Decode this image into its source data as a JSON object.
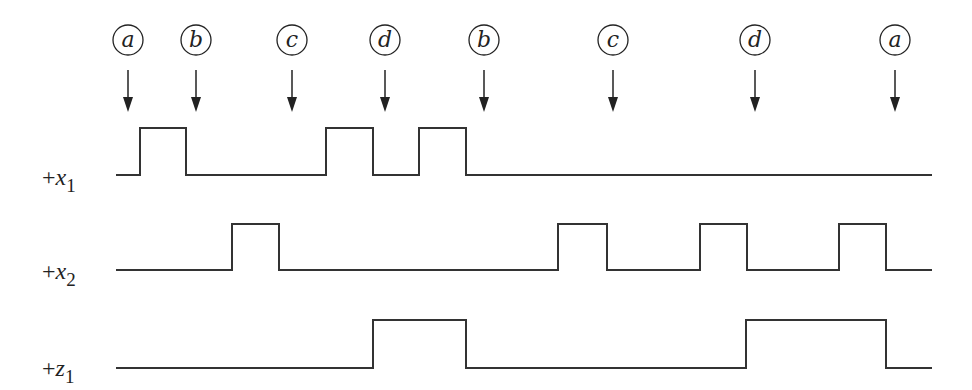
{
  "diagram": {
    "type": "timing-diagram",
    "events": [
      {
        "label": "a",
        "x": 128
      },
      {
        "label": "b",
        "x": 196
      },
      {
        "label": "c",
        "x": 292
      },
      {
        "label": "d",
        "x": 385
      },
      {
        "label": "b",
        "x": 484
      },
      {
        "label": "c",
        "x": 613
      },
      {
        "label": "d",
        "x": 755
      },
      {
        "label": "a",
        "x": 895
      }
    ],
    "signals": [
      {
        "prefix": "+",
        "var": "x",
        "sub": "1",
        "label_y": 190,
        "low_y": 175,
        "high_y": 128,
        "start_x": 116,
        "end_x": 932,
        "pulses": [
          [
            140,
            186
          ],
          [
            326,
            373
          ],
          [
            419,
            466
          ]
        ]
      },
      {
        "prefix": "+",
        "var": "x",
        "sub": "2",
        "label_y": 284,
        "low_y": 270,
        "high_y": 224,
        "start_x": 116,
        "end_x": 932,
        "pulses": [
          [
            232,
            279
          ],
          [
            558,
            607
          ],
          [
            700,
            747
          ],
          [
            839,
            886
          ]
        ]
      },
      {
        "prefix": "+",
        "var": "z",
        "sub": "1",
        "label_y": 381,
        "low_y": 368,
        "high_y": 320,
        "start_x": 116,
        "end_x": 932,
        "pulses": [
          [
            373,
            466
          ],
          [
            746,
            886
          ]
        ]
      }
    ],
    "colors": {
      "line": "#333333",
      "background": "#ffffff"
    }
  }
}
